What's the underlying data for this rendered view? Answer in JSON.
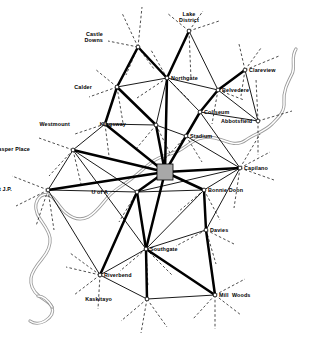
{
  "map": {
    "title": "Edmonton Transit Network Map",
    "type": "transit-network-diagram",
    "width": 311,
    "height": 340,
    "background_color": "#ffffff",
    "line_color": "#000000",
    "river_color": "#9a9a9a",
    "downtown_fill": "#a8a8a8"
  },
  "downtown": {
    "name": "Downtown",
    "x": 157,
    "y": 164,
    "w": 16,
    "h": 16
  },
  "nodes": [
    {
      "id": "lake-district",
      "label": "Lake\nDistrict",
      "x": 189,
      "y": 31,
      "lx": 178,
      "ly": 11,
      "align": "center"
    },
    {
      "id": "castle-downs",
      "label": "Castle\nDowns",
      "x": 138,
      "y": 47,
      "lx": 103,
      "ly": 31,
      "align": "right"
    },
    {
      "id": "clareview",
      "label": "Clareview",
      "x": 245,
      "y": 70,
      "lx": 249,
      "ly": 67,
      "align": "left"
    },
    {
      "id": "northgate",
      "label": "Northgate",
      "x": 167,
      "y": 78,
      "lx": 171,
      "ly": 75,
      "align": "left"
    },
    {
      "id": "calder",
      "label": "Calder",
      "x": 117,
      "y": 87,
      "lx": 92,
      "ly": 84,
      "align": "right"
    },
    {
      "id": "belvedere",
      "label": "Belvedere",
      "x": 218,
      "y": 90,
      "lx": 222,
      "ly": 87,
      "align": "left"
    },
    {
      "id": "coliseum",
      "label": "Coliseum",
      "x": 200,
      "y": 112,
      "lx": 204,
      "ly": 109,
      "align": "left"
    },
    {
      "id": "abbotsfield",
      "label": "Abbotsfield",
      "x": 258,
      "y": 121,
      "lx": 221,
      "ly": 118,
      "align": "left"
    },
    {
      "id": "westmount",
      "label": "Westmount",
      "x": 105,
      "y": 124,
      "lx": 70,
      "ly": 121,
      "align": "right"
    },
    {
      "id": "kingsway",
      "label": "Kingsway",
      "x": 156,
      "y": 125,
      "lx": 126,
      "ly": 121,
      "align": "right"
    },
    {
      "id": "stadium",
      "label": "Stadium",
      "x": 186,
      "y": 136,
      "lx": 190,
      "ly": 133,
      "align": "left"
    },
    {
      "id": "jasper-place",
      "label": "Jasper Place",
      "x": 73,
      "y": 150,
      "lx": 30,
      "ly": 146,
      "align": "right"
    },
    {
      "id": "capilano",
      "label": "Capilano",
      "x": 240,
      "y": 168,
      "lx": 244,
      "ly": 165,
      "align": "left"
    },
    {
      "id": "west-jp",
      "label": "West J.P.",
      "x": 48,
      "y": 190,
      "lx": 12,
      "ly": 186,
      "align": "right"
    },
    {
      "id": "u-of-a",
      "label": "U of A",
      "x": 137,
      "y": 192,
      "lx": 108,
      "ly": 189,
      "align": "right"
    },
    {
      "id": "bonnie-doon",
      "label": "Bonnie Doon",
      "x": 204,
      "y": 190,
      "lx": 208,
      "ly": 187,
      "align": "left"
    },
    {
      "id": "davies",
      "label": "Davies",
      "x": 206,
      "y": 230,
      "lx": 210,
      "ly": 227,
      "align": "left"
    },
    {
      "id": "southgate",
      "label": "Southgate",
      "x": 146,
      "y": 249,
      "lx": 150,
      "ly": 246,
      "align": "left"
    },
    {
      "id": "riverbend",
      "label": "Riverbend",
      "x": 100,
      "y": 275,
      "lx": 104,
      "ly": 272,
      "align": "left"
    },
    {
      "id": "kaskitayo",
      "label": "Kaskitayo",
      "x": 147,
      "y": 299,
      "lx": 112,
      "ly": 296,
      "align": "right"
    },
    {
      "id": "mill-woods",
      "label": "Mill  Woods",
      "x": 215,
      "y": 295,
      "lx": 219,
      "ly": 292,
      "align": "left"
    }
  ],
  "links_major": [
    {
      "from": "castle-downs",
      "to": "northgate"
    },
    {
      "from": "lake-district",
      "to": "northgate"
    },
    {
      "from": "northgate",
      "to": "downtown"
    },
    {
      "from": "calder",
      "to": "kingsway"
    },
    {
      "from": "calder",
      "to": "castle-downs"
    },
    {
      "from": "westmount",
      "to": "calder"
    },
    {
      "from": "westmount",
      "to": "downtown"
    },
    {
      "from": "kingsway",
      "to": "downtown"
    },
    {
      "from": "jasper-place",
      "to": "downtown"
    },
    {
      "from": "clareview",
      "to": "belvedere"
    },
    {
      "from": "belvedere",
      "to": "coliseum"
    },
    {
      "from": "coliseum",
      "to": "stadium"
    },
    {
      "from": "stadium",
      "to": "downtown"
    },
    {
      "from": "downtown",
      "to": "capilano"
    },
    {
      "from": "downtown",
      "to": "u-of-a"
    },
    {
      "from": "downtown",
      "to": "bonnie-doon"
    },
    {
      "from": "downtown",
      "to": "southgate"
    },
    {
      "from": "downtown",
      "to": "west-jp"
    },
    {
      "from": "u-of-a",
      "to": "riverbend"
    },
    {
      "from": "u-of-a",
      "to": "southgate"
    },
    {
      "from": "bonnie-doon",
      "to": "davies"
    },
    {
      "from": "davies",
      "to": "mill-woods"
    },
    {
      "from": "southgate",
      "to": "kaskitayo"
    },
    {
      "from": "southgate",
      "to": "mill-woods"
    }
  ],
  "links_minor": [
    {
      "from": "castle-downs",
      "to": "calder"
    },
    {
      "from": "lake-district",
      "to": "belvedere"
    },
    {
      "from": "northgate",
      "to": "calder"
    },
    {
      "from": "northgate",
      "to": "belvedere"
    },
    {
      "from": "northgate",
      "to": "coliseum"
    },
    {
      "from": "northgate",
      "to": "kingsway"
    },
    {
      "from": "clareview",
      "to": "abbotsfield"
    },
    {
      "from": "belvedere",
      "to": "abbotsfield"
    },
    {
      "from": "coliseum",
      "to": "abbotsfield"
    },
    {
      "from": "coliseum",
      "to": "capilano"
    },
    {
      "from": "westmount",
      "to": "kingsway"
    },
    {
      "from": "westmount",
      "to": "jasper-place"
    },
    {
      "from": "kingsway",
      "to": "stadium"
    },
    {
      "from": "stadium",
      "to": "capilano"
    },
    {
      "from": "jasper-place",
      "to": "west-jp"
    },
    {
      "from": "jasper-place",
      "to": "u-of-a"
    },
    {
      "from": "west-jp",
      "to": "u-of-a"
    },
    {
      "from": "west-jp",
      "to": "riverbend"
    },
    {
      "from": "capilano",
      "to": "bonnie-doon"
    },
    {
      "from": "capilano",
      "to": "davies"
    },
    {
      "from": "bonnie-doon",
      "to": "u-of-a"
    },
    {
      "from": "bonnie-doon",
      "to": "southgate"
    },
    {
      "from": "davies",
      "to": "southgate"
    },
    {
      "from": "davies",
      "to": "mill-woods"
    },
    {
      "from": "riverbend",
      "to": "southgate"
    },
    {
      "from": "riverbend",
      "to": "kaskitayo"
    },
    {
      "from": "kaskitayo",
      "to": "mill-woods"
    },
    {
      "from": "u-of-a",
      "to": "capilano"
    },
    {
      "from": "jasper-place",
      "to": "southgate"
    }
  ],
  "external_stubs": [
    {
      "from": "lake-district",
      "dx": -22,
      "dy": -18
    },
    {
      "from": "lake-district",
      "dx": 14,
      "dy": -20
    },
    {
      "from": "lake-district",
      "dx": 30,
      "dy": -10
    },
    {
      "from": "lake-district",
      "dx": 2,
      "dy": 48
    },
    {
      "from": "castle-downs",
      "dx": -16,
      "dy": -34
    },
    {
      "from": "castle-downs",
      "dx": 4,
      "dy": -40
    },
    {
      "from": "castle-downs",
      "dx": -30,
      "dy": -6
    },
    {
      "from": "castle-downs",
      "dx": -12,
      "dy": 28
    },
    {
      "from": "castle-downs",
      "dx": 16,
      "dy": 22
    },
    {
      "from": "clareview",
      "dx": 16,
      "dy": -22
    },
    {
      "from": "clareview",
      "dx": 34,
      "dy": -14
    },
    {
      "from": "clareview",
      "dx": -6,
      "dy": -26
    },
    {
      "from": "clareview",
      "dx": -4,
      "dy": 26
    },
    {
      "from": "northgate",
      "dx": -16,
      "dy": -28
    },
    {
      "from": "northgate",
      "dx": 22,
      "dy": 22
    },
    {
      "from": "northgate",
      "dx": -30,
      "dy": 20
    },
    {
      "from": "calder",
      "dx": -22,
      "dy": -18
    },
    {
      "from": "calder",
      "dx": -28,
      "dy": 10
    },
    {
      "from": "calder",
      "dx": 6,
      "dy": 36
    },
    {
      "from": "belvedere",
      "dx": 26,
      "dy": 10
    },
    {
      "from": "belvedere",
      "dx": -6,
      "dy": 34
    },
    {
      "from": "abbotsfield",
      "dx": -2,
      "dy": -42
    },
    {
      "from": "abbotsfield",
      "dx": 0,
      "dy": 34
    },
    {
      "from": "abbotsfield",
      "dx": 34,
      "dy": -10
    },
    {
      "from": "westmount",
      "dx": -30,
      "dy": 10
    },
    {
      "from": "westmount",
      "dx": 4,
      "dy": 32
    },
    {
      "from": "kingsway",
      "dx": -20,
      "dy": 24
    },
    {
      "from": "kingsway",
      "dx": 14,
      "dy": 28
    },
    {
      "from": "stadium",
      "dx": -20,
      "dy": 22
    },
    {
      "from": "stadium",
      "dx": 16,
      "dy": 26
    },
    {
      "from": "jasper-place",
      "dx": -34,
      "dy": -12
    },
    {
      "from": "jasper-place",
      "dx": -24,
      "dy": 26
    },
    {
      "from": "jasper-place",
      "dx": 8,
      "dy": 34
    },
    {
      "from": "capilano",
      "dx": 30,
      "dy": -16
    },
    {
      "from": "capilano",
      "dx": 34,
      "dy": 12
    },
    {
      "from": "capilano",
      "dx": -6,
      "dy": 40
    },
    {
      "from": "capilano",
      "dx": 20,
      "dy": -34
    },
    {
      "from": "west-jp",
      "dx": -36,
      "dy": -14
    },
    {
      "from": "west-jp",
      "dx": -32,
      "dy": 16
    },
    {
      "from": "west-jp",
      "dx": -12,
      "dy": 36
    },
    {
      "from": "west-jp",
      "dx": 6,
      "dy": 40
    },
    {
      "from": "u-of-a",
      "dx": -18,
      "dy": 30
    },
    {
      "from": "u-of-a",
      "dx": 6,
      "dy": 38
    },
    {
      "from": "bonnie-doon",
      "dx": -26,
      "dy": 22
    },
    {
      "from": "bonnie-doon",
      "dx": 16,
      "dy": 30
    },
    {
      "from": "davies",
      "dx": 28,
      "dy": 14
    },
    {
      "from": "davies",
      "dx": 10,
      "dy": 34
    },
    {
      "from": "davies",
      "dx": -30,
      "dy": 16
    },
    {
      "from": "southgate",
      "dx": -26,
      "dy": 22
    },
    {
      "from": "southgate",
      "dx": 2,
      "dy": 38
    },
    {
      "from": "southgate",
      "dx": 26,
      "dy": 26
    },
    {
      "from": "riverbend",
      "dx": -34,
      "dy": -8
    },
    {
      "from": "riverbend",
      "dx": -26,
      "dy": 20
    },
    {
      "from": "riverbend",
      "dx": -2,
      "dy": 34
    },
    {
      "from": "riverbend",
      "dx": -30,
      "dy": -22
    },
    {
      "from": "kaskitayo",
      "dx": -26,
      "dy": 22
    },
    {
      "from": "kaskitayo",
      "dx": -6,
      "dy": 34
    },
    {
      "from": "kaskitayo",
      "dx": 20,
      "dy": 28
    },
    {
      "from": "mill-woods",
      "dx": 26,
      "dy": 20
    },
    {
      "from": "mill-woods",
      "dx": 0,
      "dy": 34
    },
    {
      "from": "mill-woods",
      "dx": 30,
      "dy": -16
    },
    {
      "from": "mill-woods",
      "dx": -22,
      "dy": 24
    }
  ],
  "river": {
    "name": "North Saskatchewan River",
    "path": "M 296 49 C 290 58, 296 66, 292 74 C 287 84, 283 92, 284 102 C 285 112, 278 118, 272 124 C 264 132, 254 134, 246 140 C 238 146, 230 143, 222 140 C 214 137, 206 136, 198 139 C 190 142, 184 149, 176 152 C 168 155, 160 156, 152 162 C 144 168, 138 174, 130 180 C 122 186, 114 190, 108 197 C 101 205, 96 213, 88 217 C 80 221, 72 218, 66 213 C 60 208, 57 201, 52 197 C 47 193, 41 194, 38 199 C 34 205, 36 213, 40 219 C 44 225, 49 231, 50 238 C 51 246, 47 253, 42 259 C 37 265, 32 271, 31 278 C 30 286, 34 292, 39 296 C 44 300, 50 302, 52 307 C 54 313, 50 318, 45 321 C 40 324, 34 324, 30 321",
    "branch": "M 52 307 C 48 300, 44 296, 38 296"
  },
  "labels": {
    "font_size_px": 5.4,
    "weight": "bold"
  }
}
